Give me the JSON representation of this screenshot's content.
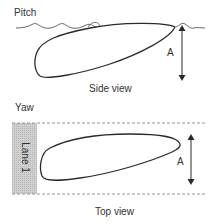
{
  "side_view": {
    "section_label": "Pitch",
    "caption": "Side view",
    "amplitude_label": "A"
  },
  "top_view": {
    "section_label": "Yaw",
    "caption": "Top view",
    "amplitude_label": "A",
    "lane_label": "Lane 1"
  },
  "colors": {
    "stroke": "#2a2a2a",
    "lane_fill": "#c8c8c8",
    "dash": "#888888",
    "text": "#333333"
  }
}
